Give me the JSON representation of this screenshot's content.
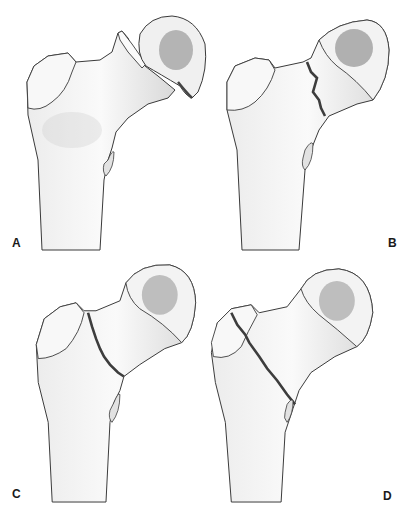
{
  "figure": {
    "panels": [
      {
        "label": "A",
        "description": "Displaced femoral neck fracture with head separated"
      },
      {
        "label": "B",
        "description": "Subcapital fracture with irregular fracture line"
      },
      {
        "label": "C",
        "description": "Transcervical fracture line across neck"
      },
      {
        "label": "D",
        "description": "Intertrochanteric / basicervical fracture line through trochanter"
      }
    ]
  },
  "colors": {
    "outline": "#3a3a3a",
    "bone_fill": "#f2f2f2",
    "shade": "#d6d6d6",
    "fovea": "#9a9a9a",
    "fracture": "#3d3d3d"
  }
}
